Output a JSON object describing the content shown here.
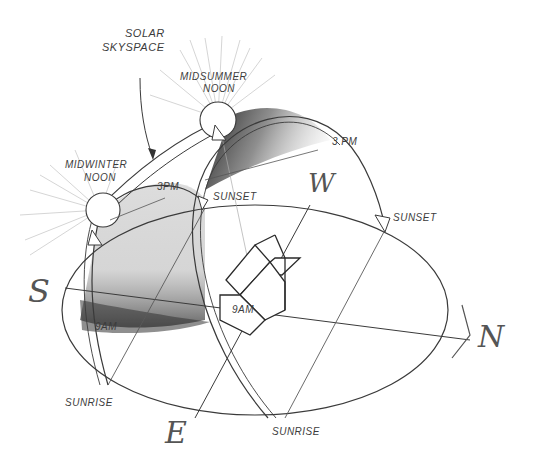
{
  "diagram": {
    "labels": {
      "solar_skyspace_line1": "SOLAR",
      "solar_skyspace_line2": "SKYSPACE",
      "midsummer_line1": "MIDSUMMER",
      "midsummer_line2": "NOON",
      "midwinter_line1": "MIDWINTER",
      "midwinter_line2": "NOON",
      "summer_3pm": "3 PM",
      "winter_3pm": "3PM",
      "winter_sunset": "SUNSET",
      "summer_sunset": "SUNSET",
      "winter_9am": "9AM",
      "summer_9am": "9AM",
      "winter_sunrise": "SUNRISE",
      "summer_sunrise": "SUNRISE"
    },
    "compass": {
      "south": "S",
      "west": "W",
      "east": "E",
      "north": "N"
    },
    "colors": {
      "pencil": "#3a3a3a",
      "light_pencil": "#9a9a9a",
      "shade_dark": "#2a2a2a",
      "background": "#ffffff"
    }
  }
}
